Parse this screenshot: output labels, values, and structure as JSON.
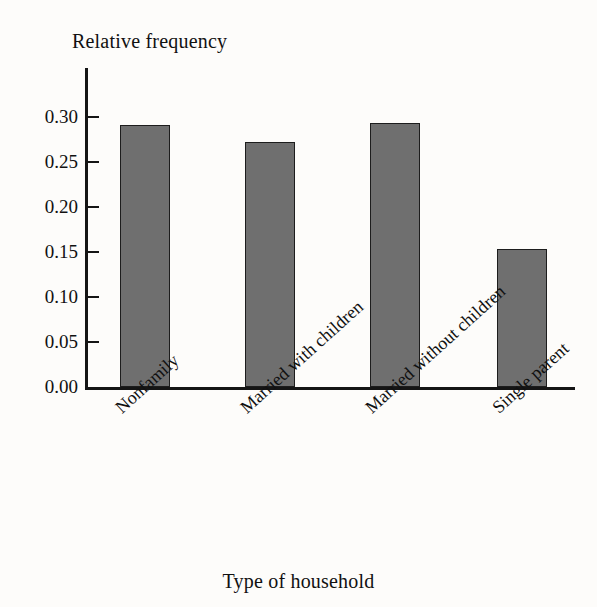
{
  "chart_data": {
    "type": "bar",
    "title": "",
    "xlabel": "Type of household",
    "ylabel": "Relative frequency",
    "categories": [
      "Nonfamily",
      "Married with children",
      "Married without children",
      "Single parent"
    ],
    "values": [
      0.291,
      0.272,
      0.293,
      0.153
    ],
    "ylim": [
      0.0,
      0.32
    ],
    "ytick_labels": [
      "0.30",
      "0.25",
      "0.20",
      "0.15",
      "0.10",
      "0.05",
      "0.00"
    ],
    "ytick_values": [
      0.3,
      0.25,
      0.2,
      0.15,
      0.1,
      0.05,
      0.0
    ],
    "grid": false,
    "legend": "none",
    "bar_color": "#6f6f6f",
    "bar_edge_color": "#1d1d1d",
    "axis_color": "#151515",
    "background_color": "#fdfcfa",
    "label_rotation_deg": -42
  }
}
